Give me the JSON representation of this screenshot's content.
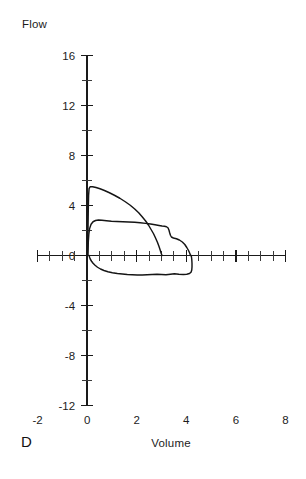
{
  "panel": {
    "letter": "D"
  },
  "labels": {
    "flow_axis_title": "Flow",
    "volume_axis_title": "Volume"
  },
  "chart_data": {
    "type": "line",
    "title": "",
    "subtitle": "",
    "xlabel": "Volume",
    "ylabel": "Flow",
    "xlim": [
      -2,
      8
    ],
    "ylim": [
      -12,
      16
    ],
    "grid": false,
    "legend": "none",
    "x_major_ticks": [
      -2,
      0,
      2,
      4,
      6,
      8
    ],
    "x_minor_ticks": [
      -1.5,
      -1,
      -0.5,
      0.5,
      1,
      1.5,
      2.5,
      3,
      3.5,
      4.5,
      5,
      5.5,
      6.5,
      7,
      7.5
    ],
    "x_tick_labels": [
      "-2",
      "0",
      "2",
      "4",
      "6",
      "8"
    ],
    "y_major_ticks": [
      -12,
      -8,
      -4,
      0,
      4,
      8,
      12,
      16
    ],
    "y_minor_ticks": [
      -10,
      -6,
      -2,
      2,
      6,
      10,
      14
    ],
    "y_tick_labels": [
      "16",
      "12",
      "8",
      "4",
      "0",
      "-4",
      "-8",
      "-12"
    ],
    "annotations": [
      "D"
    ],
    "series": [
      {
        "name": "expiratory-loop-outer",
        "points": [
          [
            0.02,
            0.0
          ],
          [
            0.03,
            1.2
          ],
          [
            0.04,
            2.6
          ],
          [
            0.05,
            3.9
          ],
          [
            0.06,
            4.8
          ],
          [
            0.08,
            5.35
          ],
          [
            0.12,
            5.5
          ],
          [
            0.22,
            5.5
          ],
          [
            0.36,
            5.44
          ],
          [
            0.52,
            5.34
          ],
          [
            0.7,
            5.2
          ],
          [
            0.9,
            5.02
          ],
          [
            1.1,
            4.82
          ],
          [
            1.32,
            4.58
          ],
          [
            1.54,
            4.3
          ],
          [
            1.74,
            4.02
          ],
          [
            1.92,
            3.72
          ],
          [
            2.08,
            3.42
          ],
          [
            2.22,
            3.1
          ],
          [
            2.36,
            2.76
          ],
          [
            2.48,
            2.42
          ],
          [
            2.58,
            2.08
          ],
          [
            2.68,
            1.74
          ],
          [
            2.76,
            1.4
          ],
          [
            2.84,
            1.04
          ],
          [
            2.9,
            0.72
          ],
          [
            2.95,
            0.42
          ],
          [
            2.99,
            0.16
          ],
          [
            3.02,
            0.0
          ]
        ]
      },
      {
        "name": "expiratory-loop-inner",
        "points": [
          [
            0.03,
            0.0
          ],
          [
            0.04,
            0.55
          ],
          [
            0.05,
            1.15
          ],
          [
            0.07,
            1.7
          ],
          [
            0.1,
            2.15
          ],
          [
            0.16,
            2.5
          ],
          [
            0.24,
            2.7
          ],
          [
            0.34,
            2.8
          ],
          [
            0.46,
            2.84
          ],
          [
            0.6,
            2.82
          ],
          [
            0.78,
            2.78
          ],
          [
            0.98,
            2.74
          ],
          [
            1.2,
            2.72
          ],
          [
            1.44,
            2.7
          ],
          [
            1.68,
            2.68
          ],
          [
            1.92,
            2.66
          ],
          [
            2.14,
            2.62
          ],
          [
            2.36,
            2.57
          ],
          [
            2.56,
            2.52
          ],
          [
            2.74,
            2.46
          ],
          [
            2.9,
            2.4
          ],
          [
            3.02,
            2.36
          ],
          [
            3.12,
            2.34
          ],
          [
            3.2,
            2.3
          ],
          [
            3.26,
            2.22
          ],
          [
            3.3,
            2.04
          ],
          [
            3.33,
            1.82
          ],
          [
            3.36,
            1.62
          ],
          [
            3.4,
            1.48
          ],
          [
            3.48,
            1.4
          ],
          [
            3.6,
            1.34
          ],
          [
            3.72,
            1.24
          ],
          [
            3.84,
            1.08
          ],
          [
            3.94,
            0.88
          ],
          [
            4.02,
            0.64
          ],
          [
            4.09,
            0.4
          ],
          [
            4.14,
            0.18
          ],
          [
            4.17,
            0.0
          ]
        ]
      },
      {
        "name": "inspiratory-limb",
        "points": [
          [
            4.2,
            0.0
          ],
          [
            4.22,
            -0.3
          ],
          [
            4.23,
            -0.62
          ],
          [
            4.23,
            -0.92
          ],
          [
            4.22,
            -1.16
          ],
          [
            4.19,
            -1.34
          ],
          [
            4.13,
            -1.44
          ],
          [
            4.02,
            -1.5
          ],
          [
            3.88,
            -1.52
          ],
          [
            3.7,
            -1.5
          ],
          [
            3.52,
            -1.46
          ],
          [
            3.36,
            -1.5
          ],
          [
            3.18,
            -1.54
          ],
          [
            3.0,
            -1.52
          ],
          [
            2.82,
            -1.5
          ],
          [
            2.62,
            -1.52
          ],
          [
            2.42,
            -1.54
          ],
          [
            2.22,
            -1.56
          ],
          [
            2.02,
            -1.56
          ],
          [
            1.82,
            -1.54
          ],
          [
            1.62,
            -1.52
          ],
          [
            1.42,
            -1.48
          ],
          [
            1.22,
            -1.44
          ],
          [
            1.02,
            -1.38
          ],
          [
            0.84,
            -1.3
          ],
          [
            0.68,
            -1.2
          ],
          [
            0.54,
            -1.08
          ],
          [
            0.42,
            -0.94
          ],
          [
            0.32,
            -0.78
          ],
          [
            0.24,
            -0.62
          ],
          [
            0.18,
            -0.46
          ],
          [
            0.13,
            -0.3
          ],
          [
            0.1,
            -0.14
          ],
          [
            0.08,
            0.0
          ]
        ]
      }
    ]
  }
}
